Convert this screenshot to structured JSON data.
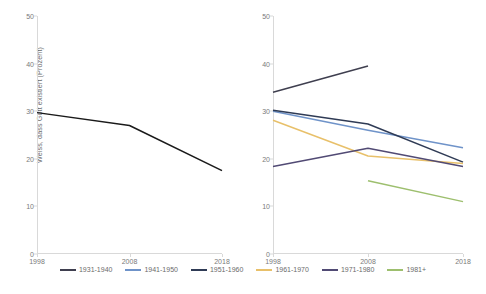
{
  "chart_data": [
    {
      "type": "line",
      "panel": "left",
      "title": "",
      "xlabel": "",
      "ylabel": "Weiss, dass Gott existiert (Prozent)",
      "x": [
        "1998",
        "2008",
        "2018"
      ],
      "xticks": [
        "1998",
        "2008",
        "2018"
      ],
      "yticks": [
        "0",
        "10",
        "20",
        "30",
        "40",
        "50"
      ],
      "ylim": [
        0,
        50
      ],
      "grid": false,
      "legend_position": "bottom",
      "series": [
        {
          "name": "Gesamt",
          "color": "#1a1a1a",
          "values": [
            29.7,
            27.0,
            17.5
          ]
        }
      ]
    },
    {
      "type": "line",
      "panel": "right",
      "title": "",
      "xlabel": "",
      "ylabel": "",
      "x": [
        "1998",
        "2008",
        "2018"
      ],
      "xticks": [
        "1998",
        "2008",
        "2018"
      ],
      "yticks": [
        "0",
        "10",
        "20",
        "30",
        "40",
        "50"
      ],
      "ylim": [
        0,
        50
      ],
      "grid": false,
      "legend_position": "bottom",
      "series": [
        {
          "name": "1931-1940",
          "color": "#3f3f4f",
          "values": [
            34.0,
            39.5,
            null
          ]
        },
        {
          "name": "1941-1950",
          "color": "#6f93c9",
          "values": [
            30.0,
            26.0,
            22.3
          ]
        },
        {
          "name": "1951-1960",
          "color": "#2f3b55",
          "values": [
            30.2,
            27.3,
            19.3
          ]
        },
        {
          "name": "1961-1970",
          "color": "#e8c06a",
          "values": [
            28.1,
            20.6,
            19.0
          ]
        },
        {
          "name": "1971-1980",
          "color": "#514a74",
          "values": [
            18.4,
            22.2,
            18.4
          ]
        },
        {
          "name": "1981+",
          "color": "#9dbf6e",
          "values": [
            null,
            15.4,
            11.0
          ]
        }
      ]
    }
  ],
  "legend": {
    "items": [
      {
        "label": "1931-1940",
        "color": "#3f3f4f"
      },
      {
        "label": "1941-1950",
        "color": "#6f93c9"
      },
      {
        "label": "1951-1960",
        "color": "#2f3b55"
      },
      {
        "label": "1961-1970",
        "color": "#e8c06a"
      },
      {
        "label": "1971-1980",
        "color": "#514a74"
      },
      {
        "label": "1981+",
        "color": "#9dbf6e"
      }
    ]
  }
}
